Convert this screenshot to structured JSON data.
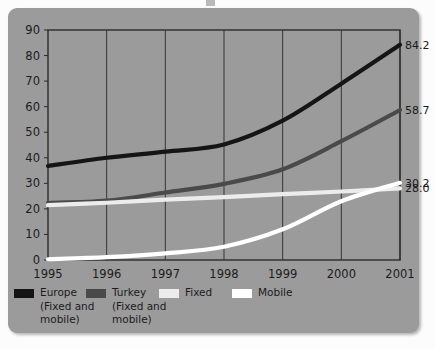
{
  "panel": {
    "background_color": "#9b9b9b",
    "page_background": "#fcfcfc"
  },
  "chart_data": {
    "type": "line",
    "title": "",
    "subtitle": "",
    "xlabel": "",
    "ylabel": "",
    "x": [
      1995,
      1996,
      1997,
      1998,
      1999,
      2000,
      2001
    ],
    "categories": [
      "1995",
      "1996",
      "1997",
      "1998",
      "1999",
      "2000",
      "2001"
    ],
    "xtick_labels": [
      "1995",
      "1996",
      "1997",
      "1998",
      "1999",
      "2000",
      "2001"
    ],
    "ytick_labels": [
      "0",
      "10",
      "20",
      "30",
      "40",
      "50",
      "60",
      "70",
      "80",
      "90"
    ],
    "ylim": [
      0,
      90
    ],
    "xlim": [
      1995,
      2001
    ],
    "ytick_step": 10,
    "grid": "vertical",
    "legend_position": "bottom",
    "series": [
      {
        "name": "Europe",
        "sublabel": "(Fixed and\nmobile)",
        "color": "#151515",
        "values": [
          36.8,
          40.0,
          42.4,
          45.2,
          54.5,
          69.0,
          84.2
        ],
        "end_label": "84.2"
      },
      {
        "name": "Turkey",
        "sublabel": "(Fixed and\nmobile)",
        "color": "#4a4a4a",
        "values": [
          22.3,
          23.2,
          26.4,
          29.8,
          35.5,
          46.5,
          58.7
        ],
        "end_label": "58.7"
      },
      {
        "name": "Fixed",
        "sublabel": "",
        "color": "#ececec",
        "values": [
          21.5,
          22.4,
          23.6,
          24.6,
          25.8,
          26.8,
          28.0
        ],
        "end_label": "28.0"
      },
      {
        "name": "Mobile",
        "sublabel": "",
        "color": "#ffffff",
        "values": [
          0.3,
          1.1,
          2.6,
          5.2,
          12.0,
          23.0,
          30.2
        ],
        "end_label": "30.2"
      }
    ]
  },
  "legend": {
    "items": [
      {
        "label": "Europe",
        "sublabel": "(Fixed and\nmobile)",
        "color": "#151515"
      },
      {
        "label": "Turkey",
        "sublabel": "(Fixed and\nmobile)",
        "color": "#4a4a4a"
      },
      {
        "label": "Fixed",
        "sublabel": "",
        "color": "#ececec"
      },
      {
        "label": "Mobile",
        "sublabel": "",
        "color": "#ffffff"
      }
    ]
  }
}
